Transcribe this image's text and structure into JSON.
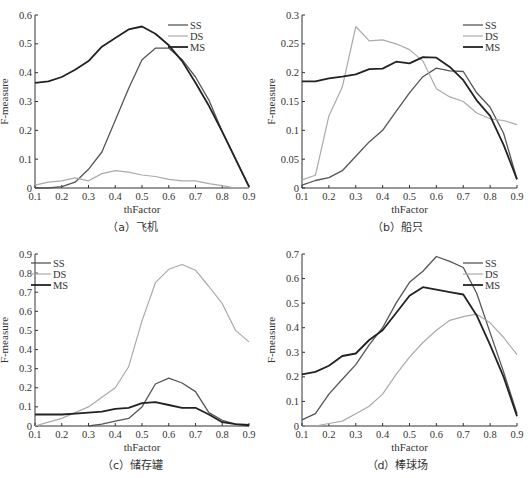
{
  "chart_data": [
    {
      "type": "line",
      "panel": "a",
      "caption": "（a）飞机",
      "xlabel": "thFactor",
      "ylabel": "F-measure",
      "xlim": [
        0.1,
        0.9
      ],
      "ylim": [
        0,
        0.6
      ],
      "xticks": [
        "0.1",
        "0.2",
        "0.3",
        "0.4",
        "0.5",
        "0.6",
        "0.7",
        "0.8",
        "0.9"
      ],
      "yticks": [
        "0",
        "0.1",
        "0.2",
        "0.3",
        "0.4",
        "0.5",
        "0.6"
      ],
      "yticks_values": [
        0,
        0.1,
        0.2,
        0.3,
        0.4,
        0.5,
        0.6
      ],
      "legend_position": "top-right",
      "x": [
        0.1,
        0.15,
        0.2,
        0.25,
        0.3,
        0.35,
        0.4,
        0.45,
        0.5,
        0.55,
        0.6,
        0.65,
        0.7,
        0.75,
        0.8,
        0.85,
        0.9
      ],
      "series": [
        {
          "name": "SS",
          "color": "#555555",
          "width": 1.3,
          "values": [
            0,
            0,
            0.005,
            0.02,
            0.065,
            0.125,
            0.235,
            0.345,
            0.445,
            0.485,
            0.485,
            0.445,
            0.385,
            0.305,
            0.195,
            0.1,
            0.005
          ]
        },
        {
          "name": "DS",
          "color": "#aaaaaa",
          "width": 1.2,
          "values": [
            0.01,
            0.02,
            0.025,
            0.035,
            0.025,
            0.05,
            0.06,
            0.055,
            0.045,
            0.04,
            0.03,
            0.025,
            0.025,
            0.015,
            0.008,
            0,
            0
          ]
        },
        {
          "name": "MS",
          "color": "#222222",
          "width": 1.8,
          "values": [
            0.365,
            0.37,
            0.385,
            0.41,
            0.44,
            0.49,
            0.52,
            0.55,
            0.56,
            0.535,
            0.495,
            0.44,
            0.365,
            0.285,
            0.195,
            0.1,
            0.005
          ]
        }
      ]
    },
    {
      "type": "line",
      "panel": "b",
      "caption": "（b）船只",
      "xlabel": "thFactor",
      "ylabel": "F-measure",
      "xlim": [
        0.1,
        0.9
      ],
      "ylim": [
        0,
        0.3
      ],
      "xticks": [
        "0.1",
        "0.2",
        "0.3",
        "0.4",
        "0.5",
        "0.6",
        "0.7",
        "0.8",
        "0.9"
      ],
      "yticks": [
        "0",
        "0.05",
        "0.1",
        "0.15",
        "0.2",
        "0.25",
        "0.3"
      ],
      "yticks_values": [
        0,
        0.05,
        0.1,
        0.15,
        0.2,
        0.25,
        0.3
      ],
      "legend_position": "top-right",
      "x": [
        0.1,
        0.15,
        0.2,
        0.25,
        0.3,
        0.35,
        0.4,
        0.45,
        0.5,
        0.55,
        0.6,
        0.65,
        0.7,
        0.75,
        0.8,
        0.85,
        0.9
      ],
      "series": [
        {
          "name": "SS",
          "color": "#555555",
          "width": 1.3,
          "values": [
            0.005,
            0.013,
            0.018,
            0.03,
            0.055,
            0.08,
            0.1,
            0.133,
            0.165,
            0.193,
            0.208,
            0.203,
            0.202,
            0.165,
            0.14,
            0.095,
            0.015
          ]
        },
        {
          "name": "DS",
          "color": "#aaaaaa",
          "width": 1.2,
          "values": [
            0.014,
            0.022,
            0.125,
            0.175,
            0.28,
            0.255,
            0.257,
            0.25,
            0.24,
            0.22,
            0.172,
            0.158,
            0.15,
            0.13,
            0.12,
            0.117,
            0.11
          ]
        },
        {
          "name": "MS",
          "color": "#222222",
          "width": 1.8,
          "values": [
            0.185,
            0.185,
            0.19,
            0.193,
            0.197,
            0.206,
            0.207,
            0.219,
            0.216,
            0.227,
            0.226,
            0.21,
            0.187,
            0.152,
            0.125,
            0.075,
            0.015
          ]
        }
      ]
    },
    {
      "type": "line",
      "panel": "c",
      "caption": "（c）储存罐",
      "xlabel": "thFactor",
      "ylabel": "F-measure",
      "xlim": [
        0.1,
        0.9
      ],
      "ylim": [
        0,
        0.9
      ],
      "xticks": [
        "0.1",
        "0.2",
        "0.3",
        "0.4",
        "0.5",
        "0.6",
        "0.7",
        "0.8",
        "0.9"
      ],
      "yticks": [
        "0",
        "0.1",
        "0.2",
        "0.3",
        "0.4",
        "0.5",
        "0.6",
        "0.7",
        "0.8",
        "0.9"
      ],
      "yticks_values": [
        0,
        0.1,
        0.2,
        0.3,
        0.4,
        0.5,
        0.6,
        0.7,
        0.8,
        0.9
      ],
      "legend_position": "top-left",
      "x": [
        0.1,
        0.15,
        0.2,
        0.25,
        0.3,
        0.35,
        0.4,
        0.45,
        0.5,
        0.55,
        0.6,
        0.65,
        0.7,
        0.75,
        0.8,
        0.85,
        0.9
      ],
      "series": [
        {
          "name": "SS",
          "color": "#555555",
          "width": 1.3,
          "values": [
            null,
            null,
            null,
            null,
            0,
            0.01,
            0.025,
            0.04,
            0.1,
            0.22,
            0.25,
            0.225,
            0.18,
            0.07,
            0.03,
            0.01,
            0
          ]
        },
        {
          "name": "DS",
          "color": "#aaaaaa",
          "width": 1.2,
          "values": [
            0,
            0.02,
            0.04,
            0.07,
            0.1,
            0.15,
            0.2,
            0.31,
            0.55,
            0.75,
            0.82,
            0.845,
            0.815,
            0.73,
            0.64,
            0.5,
            0.44
          ]
        },
        {
          "name": "MS",
          "color": "#222222",
          "width": 1.8,
          "values": [
            0.06,
            0.06,
            0.06,
            0.065,
            0.07,
            0.075,
            0.09,
            0.095,
            0.12,
            0.125,
            0.11,
            0.095,
            0.095,
            0.06,
            0.02,
            0.01,
            0.005
          ]
        }
      ]
    },
    {
      "type": "line",
      "panel": "d",
      "caption": "（d）棒球场",
      "xlabel": "thFactor",
      "ylabel": "F-measure",
      "xlim": [
        0.1,
        0.9
      ],
      "ylim": [
        0,
        0.7
      ],
      "xticks": [
        "0.1",
        "0.2",
        "0.3",
        "0.4",
        "0.5",
        "0.6",
        "0.7",
        "0.8",
        "0.9"
      ],
      "yticks": [
        "0",
        "0.1",
        "0.2",
        "0.3",
        "0.4",
        "0.5",
        "0.6",
        "0.7"
      ],
      "yticks_values": [
        0,
        0.1,
        0.2,
        0.3,
        0.4,
        0.5,
        0.6,
        0.7
      ],
      "legend_position": "top-right",
      "x": [
        0.1,
        0.15,
        0.2,
        0.25,
        0.3,
        0.35,
        0.4,
        0.45,
        0.5,
        0.55,
        0.6,
        0.65,
        0.7,
        0.75,
        0.8,
        0.85,
        0.9
      ],
      "series": [
        {
          "name": "SS",
          "color": "#555555",
          "width": 1.3,
          "values": [
            0.025,
            0.05,
            0.13,
            0.19,
            0.25,
            0.33,
            0.4,
            0.5,
            0.585,
            0.63,
            0.69,
            0.67,
            0.645,
            0.54,
            0.38,
            0.22,
            0.05
          ]
        },
        {
          "name": "DS",
          "color": "#aaaaaa",
          "width": 1.2,
          "values": [
            0,
            0,
            0.01,
            0.02,
            0.05,
            0.08,
            0.13,
            0.21,
            0.28,
            0.34,
            0.39,
            0.43,
            0.445,
            0.455,
            0.42,
            0.36,
            0.29
          ]
        },
        {
          "name": "MS",
          "color": "#222222",
          "width": 1.8,
          "values": [
            0.21,
            0.22,
            0.245,
            0.285,
            0.295,
            0.35,
            0.39,
            0.46,
            0.53,
            0.565,
            0.555,
            0.545,
            0.535,
            0.45,
            0.33,
            0.2,
            0.04
          ]
        }
      ]
    }
  ]
}
